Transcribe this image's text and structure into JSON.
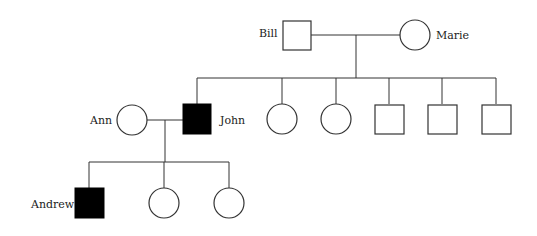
{
  "diagram": {
    "type": "pedigree-chart",
    "individuals": {
      "bill": {
        "label": "Bill",
        "sex": "male",
        "affected": false
      },
      "marie": {
        "label": "Marie",
        "sex": "female",
        "affected": false
      },
      "ann": {
        "label": "Ann",
        "sex": "female",
        "affected": false
      },
      "john": {
        "label": "John",
        "sex": "male",
        "affected": true
      },
      "andrew": {
        "label": "Andrew",
        "sex": "male",
        "affected": true
      }
    },
    "generation2_unlabeled": [
      "female",
      "female",
      "male",
      "male",
      "male"
    ],
    "generation3_unlabeled": [
      "female",
      "female"
    ],
    "colors": {
      "affected": "#000000",
      "unaffected": "#ffffff",
      "line": "#333333"
    }
  }
}
